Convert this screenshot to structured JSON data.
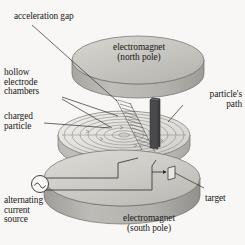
{
  "figure": {
    "background_color": "#f8f7f5",
    "ink_color": "#1a1a1a",
    "labels": {
      "acceleration_gap": "acceleration gap",
      "hollow_electrode_chambers": "hollow\nelectrode\nchambers",
      "charged_particle": "charged\nparticle",
      "alternating_current_source": "alternating\ncurrent\nsource",
      "electromagnet_north": "electromagnet\n(north pole)",
      "electromagnet_south": "electromagnet\n(south pole)",
      "particles_path": "particle's\npath",
      "target": "target"
    },
    "components": {
      "top_disc": {
        "name": "electromagnet north pole disc",
        "fill_top": "#c9c7c2",
        "fill_side": "#b0aeaa"
      },
      "middle_disc": {
        "name": "dee chamber disc with spiral particle path",
        "fill_top": "#e3e1dd",
        "fill_side": "#bcbab6",
        "spiral_turns": 7
      },
      "bottom_disc": {
        "name": "electromagnet south pole disc",
        "fill_top": "#cdcbc6",
        "fill_side": "#a9a7a3"
      },
      "gap_plate": {
        "name": "acceleration gap dark plate",
        "fill": "#4a4a4c"
      },
      "ac_source": {
        "name": "alternating current source symbol",
        "symbol": "sine-wave-in-circle"
      },
      "target_marker": {
        "name": "target flag marker"
      }
    }
  }
}
